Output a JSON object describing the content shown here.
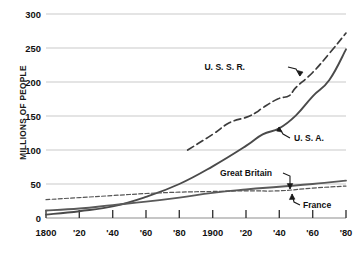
{
  "chart_data": {
    "type": "line",
    "title": "",
    "xlabel": "",
    "ylabel": "MILLIONS OF PEOPLE",
    "xlim": [
      1800,
      1980
    ],
    "ylim": [
      0,
      300
    ],
    "grid": true,
    "legend_position": "inline-annotations",
    "x_ticks": [
      1800,
      1820,
      1840,
      1860,
      1880,
      1900,
      1920,
      1940,
      1960,
      1980
    ],
    "x_tick_labels": [
      "1800",
      "'20",
      "'40",
      "'60",
      "'80",
      "1900",
      "'20",
      "'40",
      "'60",
      "'80"
    ],
    "y_ticks": [
      0,
      50,
      100,
      150,
      200,
      250,
      300
    ],
    "y_tick_labels": [
      "0",
      "50",
      "100",
      "150",
      "200",
      "250",
      "300"
    ],
    "series": [
      {
        "name": "U. S. S. R.",
        "style": "dashed",
        "color": "#3b3b3b",
        "x": [
          1885,
          1900,
          1910,
          1920,
          1926,
          1930,
          1939,
          1946,
          1950,
          1960,
          1970,
          1980
        ],
        "values": [
          100,
          123,
          140,
          148,
          155,
          162,
          175,
          180,
          192,
          214,
          242,
          272
        ]
      },
      {
        "name": "U. S. A.",
        "style": "solid",
        "color": "#4a4a4a",
        "x": [
          1800,
          1820,
          1840,
          1860,
          1880,
          1900,
          1920,
          1930,
          1940,
          1950,
          1960,
          1970,
          1980
        ],
        "values": [
          5,
          10,
          17,
          31,
          50,
          76,
          106,
          123,
          132,
          151,
          179,
          203,
          248
        ]
      },
      {
        "name": "Great Britain",
        "style": "solid",
        "color": "#5a5a5a",
        "x": [
          1800,
          1820,
          1840,
          1860,
          1880,
          1900,
          1920,
          1940,
          1960,
          1980
        ],
        "values": [
          11,
          14,
          19,
          24,
          30,
          37,
          42,
          46,
          50,
          55
        ]
      },
      {
        "name": "France",
        "style": "dotted-dashed",
        "color": "#555555",
        "x": [
          1800,
          1820,
          1840,
          1860,
          1880,
          1900,
          1920,
          1940,
          1960,
          1980
        ],
        "values": [
          27,
          30,
          33,
          36,
          38,
          39,
          40,
          40,
          44,
          47
        ]
      }
    ],
    "annotations": [
      {
        "label": "U. S. S. R.",
        "target_series": "U. S. S. R.",
        "text_x": 245,
        "text_y": 70
      },
      {
        "label": "U. S. A.",
        "target_series": "U. S. A.",
        "text_x": 292,
        "text_y": 140
      },
      {
        "label": "Great Britain",
        "target_series": "Great Britain",
        "text_x": 220,
        "text_y": 175
      },
      {
        "label": "France",
        "target_series": "France",
        "text_x": 303,
        "text_y": 207
      }
    ]
  },
  "axis": {
    "y_label": "MILLIONS OF PEOPLE",
    "y_tick_0": "0",
    "y_tick_50": "50",
    "y_tick_100": "100",
    "y_tick_150": "150",
    "y_tick_200": "200",
    "y_tick_250": "250",
    "y_tick_300": "300",
    "x_tick_1800": "1800",
    "x_tick_1820": "'20",
    "x_tick_1840": "'40",
    "x_tick_1860": "'60",
    "x_tick_1880": "'80",
    "x_tick_1900": "1900",
    "x_tick_1920": "'20",
    "x_tick_1940": "'40",
    "x_tick_1960": "'60",
    "x_tick_1980": "'80"
  },
  "labels": {
    "ussr": "U. S. S. R.",
    "usa": "U. S. A.",
    "great_britain": "Great Britain",
    "france": "France"
  },
  "colors": {
    "grid": "#c9c9c9",
    "axis": "#4a4a4a",
    "line": "#4a4a4a",
    "text": "#111111",
    "background": "#ffffff"
  }
}
